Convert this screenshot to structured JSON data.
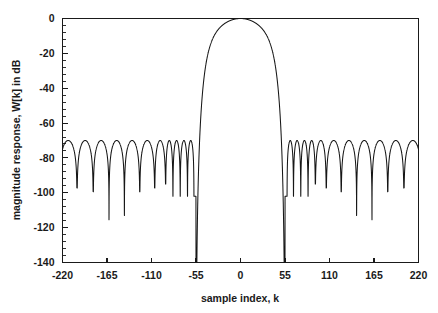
{
  "chart_data": {
    "type": "line",
    "title": "",
    "subtitle": "",
    "xlabel": "sample index, k",
    "ylabel": "magnitude response, W[k] in dB",
    "xlim": [
      -220,
      220
    ],
    "ylim": [
      -140,
      0
    ],
    "grid": false,
    "legend": null,
    "legend_position": "none",
    "x_ticks": [
      -220,
      -165,
      -110,
      -55,
      0,
      55,
      110,
      165,
      220
    ],
    "x_tick_labels": [
      "-220",
      "-165",
      "-110",
      "-55",
      "0",
      "55",
      "110",
      "165",
      "220"
    ],
    "x_minor_tick_count_per_interval": 0,
    "y_ticks": [
      0,
      -20,
      -40,
      -60,
      -80,
      -100,
      -120,
      -140
    ],
    "y_tick_labels": [
      "0",
      "-20",
      "-40",
      "-60",
      "-80",
      "-100",
      "-120",
      "-140"
    ],
    "y_minor_tick_count_per_interval": 4,
    "line_color": "#161616",
    "background_color": "#ffffff",
    "axis_color": "#1a1a1a",
    "main_lobe": {
      "peak_x": 0,
      "peak_y": 0,
      "left_edge_x": -55,
      "right_edge_x": 55,
      "half_width": 55
    },
    "sidelobes": {
      "peak_level_db": -70,
      "null_floor_typical_db": -95,
      "deepest_null_db": -129,
      "deepest_null_x": [
        -155,
        155
      ],
      "count_per_side": 11,
      "peak_x_left": [
        -212,
        -192,
        -172,
        -153,
        -134,
        -115,
        -97,
        -88,
        -79,
        -70,
        -61
      ],
      "peak_x_right": [
        61,
        70,
        79,
        88,
        97,
        115,
        134,
        153,
        172,
        192,
        212
      ]
    },
    "series": [
      {
        "name": "W[k]",
        "x_range": [
          -220,
          220
        ],
        "y_peak": 0,
        "y_floor": -140
      }
    ]
  }
}
